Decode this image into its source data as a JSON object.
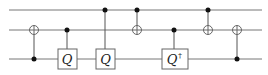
{
  "diagram": {
    "type": "quantum-circuit",
    "wires": [
      {
        "name": "qubit-1",
        "y": 10
      },
      {
        "name": "qubit-2",
        "y": 30
      },
      {
        "name": "qubit-3",
        "y": 59
      }
    ],
    "wire_x_start": 9,
    "wire_x_end": 262,
    "gates": [
      {
        "kind": "cnot",
        "x": 34,
        "control": 2,
        "target": 1
      },
      {
        "kind": "controlled-box",
        "x": 67,
        "control": 1,
        "target": 2,
        "label": "Q",
        "sup": ""
      },
      {
        "kind": "controlled-box",
        "x": 105,
        "control": 0,
        "target": 2,
        "label": "Q",
        "sup": ""
      },
      {
        "kind": "cnot",
        "x": 137,
        "control": 0,
        "target": 1
      },
      {
        "kind": "controlled-box",
        "x": 174,
        "control": 1,
        "target": 2,
        "label": "Q",
        "sup": "†"
      },
      {
        "kind": "cnot",
        "x": 208,
        "control": 0,
        "target": 1
      },
      {
        "kind": "cnot",
        "x": 237,
        "control": 2,
        "target": 1
      }
    ],
    "labels": {
      "g2": "Q",
      "g3": "Q",
      "g5": "Q",
      "g5_sup": "†"
    }
  }
}
